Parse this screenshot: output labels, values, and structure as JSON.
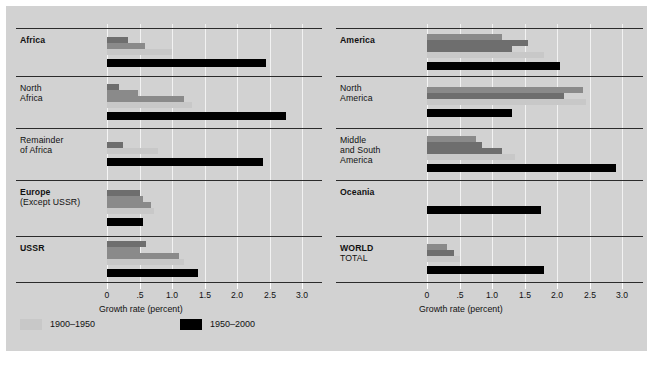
{
  "figure": {
    "background": "#d2d2d2",
    "page_background": "#ffffff"
  },
  "axis": {
    "title": "Growth rate (percent)",
    "ticks": [
      "0",
      ".5",
      "1.0",
      "1.5",
      "2.0",
      "2.5",
      "3.0"
    ],
    "tick_values": [
      0,
      0.5,
      1.0,
      1.5,
      2.0,
      2.5,
      3.0
    ],
    "min": 0,
    "max": 3.0
  },
  "legend": {
    "items": [
      {
        "label": "1900–1950",
        "color": "#c8c8c8"
      },
      {
        "label": "1950–2000",
        "color": "#000000"
      }
    ]
  },
  "palette": {
    "seg_dark": "#6e6e6e",
    "seg_mid": "#8a8a8a",
    "seg_light": "#c8c8c8",
    "black": "#000000",
    "rule": "#2b2b2b",
    "gridline": "#f2f2f2"
  },
  "chart_data": {
    "type": "bar",
    "title": "",
    "xlabel": "Growth rate (percent)",
    "ylabel": "",
    "xlim": [
      0,
      3.0
    ],
    "grid": true,
    "orientation": "horizontal",
    "legend_position": "bottom-left",
    "series": [
      {
        "name": "1900–1950",
        "color": "#c8c8c8"
      },
      {
        "name": "1950–2000",
        "color": "#000000"
      }
    ],
    "note": "Each region shows stacked sub-period bars shaded dark→light for 1900–1950, plus a single black bar for 1950–2000.",
    "panels": [
      {
        "name": "left-panel",
        "rows": [
          {
            "label": "Africa",
            "label_lines": [
              "Africa"
            ],
            "bold": true,
            "segments": [
              {
                "shade": "seg_dark",
                "value": 0.32
              },
              {
                "shade": "seg_mid",
                "value": 0.58
              },
              {
                "shade": "seg_light",
                "value": 1.0
              }
            ],
            "black": 2.45
          },
          {
            "label": "North Africa",
            "label_lines": [
              "North",
              "Africa"
            ],
            "bold": false,
            "segments": [
              {
                "shade": "seg_dark",
                "value": 0.18
              },
              {
                "shade": "seg_mid",
                "value": 0.47
              },
              {
                "shade": "seg_mid",
                "value": 1.18
              },
              {
                "shade": "seg_light",
                "value": 1.3
              }
            ],
            "black": 2.75
          },
          {
            "label": "Remainder of Africa",
            "label_lines": [
              "Remainder",
              "of Africa"
            ],
            "bold": false,
            "segments": [
              {
                "shade": "seg_dark",
                "value": 0.25
              },
              {
                "shade": "seg_light",
                "value": 0.78
              }
            ],
            "black": 2.4
          },
          {
            "label": "Europe (Except USSR)",
            "label_lines": [
              "Europe",
              "(Except USSR)"
            ],
            "bold": true,
            "segments": [
              {
                "shade": "seg_dark",
                "value": 0.5
              },
              {
                "shade": "seg_mid",
                "value": 0.55
              },
              {
                "shade": "seg_mid",
                "value": 0.67
              },
              {
                "shade": "seg_light",
                "value": 0.72
              }
            ],
            "black": 0.55
          },
          {
            "label": "USSR",
            "label_lines": [
              "USSR"
            ],
            "bold": true,
            "segments": [
              {
                "shade": "seg_dark",
                "value": 0.6
              },
              {
                "shade": "seg_mid",
                "value": 0.5
              },
              {
                "shade": "seg_mid",
                "value": 1.1
              },
              {
                "shade": "seg_light",
                "value": 1.18
              }
            ],
            "black": 1.4
          }
        ]
      },
      {
        "name": "right-panel",
        "rows": [
          {
            "label": "America",
            "label_lines": [
              "America"
            ],
            "bold": true,
            "segments": [
              {
                "shade": "seg_mid",
                "value": 1.15
              },
              {
                "shade": "seg_dark",
                "value": 1.55
              },
              {
                "shade": "seg_dark",
                "value": 1.3
              },
              {
                "shade": "seg_light",
                "value": 1.8
              }
            ],
            "black": 2.05
          },
          {
            "label": "North America",
            "label_lines": [
              "North",
              "America"
            ],
            "bold": false,
            "segments": [
              {
                "shade": "seg_mid",
                "value": 2.4
              },
              {
                "shade": "seg_dark",
                "value": 2.1
              },
              {
                "shade": "seg_light",
                "value": 2.45
              }
            ],
            "black": 1.3
          },
          {
            "label": "Middle and South America",
            "label_lines": [
              "Middle",
              "and South",
              "America"
            ],
            "bold": false,
            "segments": [
              {
                "shade": "seg_mid",
                "value": 0.75
              },
              {
                "shade": "seg_dark",
                "value": 0.85
              },
              {
                "shade": "seg_dark",
                "value": 1.15
              },
              {
                "shade": "seg_light",
                "value": 1.35
              }
            ],
            "black": 2.9
          },
          {
            "label": "Oceania",
            "label_lines": [
              "Oceania"
            ],
            "bold": true,
            "segments": [],
            "black": 1.75
          },
          {
            "label": "WORLD TOTAL",
            "label_lines": [
              "WORLD",
              "TOTAL"
            ],
            "bold": true,
            "segments": [
              {
                "shade": "seg_mid",
                "value": 0.3
              },
              {
                "shade": "seg_dark",
                "value": 0.42
              },
              {
                "shade": "seg_light",
                "value": 0.5
              }
            ],
            "black": 1.8
          }
        ]
      }
    ]
  }
}
